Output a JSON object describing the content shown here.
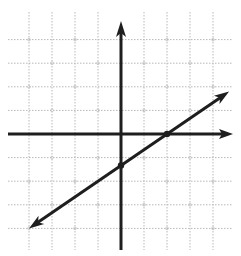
{
  "chart_data": {
    "type": "line",
    "title": "",
    "xlabel": "",
    "ylabel": "",
    "grid": true,
    "xlim": [
      -5,
      5
    ],
    "ylim": [
      -5,
      5
    ],
    "grid_step": 1,
    "axes": {
      "x_arrow": "right",
      "y_arrow": "up"
    },
    "series": [
      {
        "name": "line",
        "equation": "y = (2/3)x - 4/3",
        "slope": 0.6667,
        "y_intercept": -1.3333,
        "x_intercept": 2,
        "arrows": "both",
        "endpoints": [
          [
            -4,
            -4
          ],
          [
            4.7,
            1.8
          ]
        ],
        "marked_points": [
          [
            0,
            -1.3333
          ],
          [
            2,
            0
          ]
        ]
      }
    ]
  },
  "colors": {
    "axis": "#1e1e1e",
    "line": "#1e1e1e",
    "grid": "#b8b8b8",
    "background": "#ffffff"
  }
}
